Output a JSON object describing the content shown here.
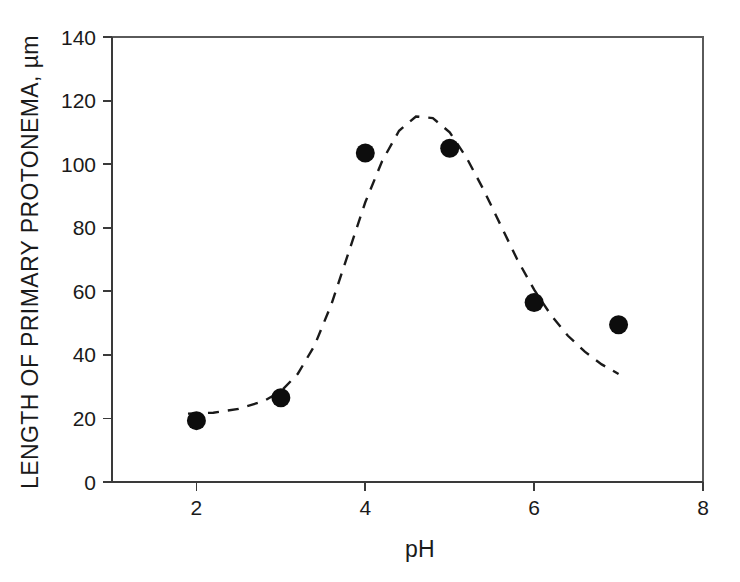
{
  "chart_data": {
    "type": "scatter",
    "title": "",
    "xlabel": "pH",
    "ylabel": "LENGTH OF PRIMARY PROTONEMA, µm",
    "xlim": [
      1,
      8
    ],
    "ylim": [
      0,
      140
    ],
    "xticks": [
      2,
      4,
      6,
      8
    ],
    "xtick_labels": [
      "2",
      "4",
      "6",
      "8"
    ],
    "yticks": [
      0,
      20,
      40,
      60,
      80,
      100,
      120,
      140
    ],
    "ytick_labels": [
      "0",
      "20",
      "40",
      "60",
      "80",
      "100",
      "120",
      "140"
    ],
    "grid": false,
    "legend": null,
    "series": [
      {
        "name": "Length of primary protonema",
        "marker": "filled-circle",
        "marker_color": "#0d0d0d",
        "x": [
          2,
          3,
          4,
          5,
          6,
          7
        ],
        "values": [
          19.3,
          26.5,
          103.5,
          105.0,
          56.5,
          49.5
        ]
      },
      {
        "name": "Fitted curve",
        "style": "dashed",
        "color": "#1a1a1a",
        "x": [
          1.9,
          2.2,
          2.5,
          2.8,
          3.0,
          3.2,
          3.4,
          3.6,
          3.8,
          4.0,
          4.2,
          4.4,
          4.6,
          4.8,
          5.0,
          5.2,
          5.4,
          5.6,
          5.8,
          6.0,
          6.2,
          6.4,
          6.6,
          6.8,
          7.0
        ],
        "values": [
          21.5,
          21.8,
          23.0,
          25.5,
          28.5,
          34.0,
          43.0,
          56.0,
          72.0,
          88.0,
          101.0,
          110.5,
          115.0,
          114.5,
          110.0,
          102.0,
          92.0,
          81.0,
          70.0,
          60.5,
          52.5,
          46.0,
          41.0,
          37.0,
          34.0
        ]
      }
    ]
  },
  "axes": {
    "x_axis_label": "pH",
    "y_axis_label": "LENGTH OF PRIMARY PROTONEMA, µm"
  },
  "colors": {
    "marker": "#0d0d0d",
    "curve": "#1a1a1a",
    "axis": "#3a3a3a",
    "frame": "#5a5a5a",
    "background": "#ffffff"
  }
}
